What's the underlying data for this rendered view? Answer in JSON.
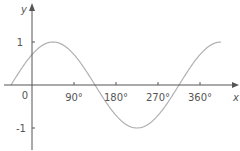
{
  "chart_data": {
    "type": "line",
    "title": "",
    "xlabel": "x",
    "ylabel": "y",
    "function": "y = sin(x + 45°)",
    "xlim": [
      -45,
      405
    ],
    "ylim": [
      -1,
      1
    ],
    "x_ticks": [
      "90°",
      "180°",
      "270°",
      "360°"
    ],
    "y_ticks": [
      "1",
      "-1"
    ],
    "origin_label": "0",
    "grid": false,
    "legend": null,
    "series": [
      {
        "name": "curve",
        "color": "#b0b0b0",
        "x": [
          -45,
          0,
          45,
          90,
          135,
          180,
          225,
          270,
          315,
          360,
          405
        ],
        "y": [
          0,
          0.71,
          1,
          0.71,
          0,
          -0.71,
          -1,
          -0.71,
          0,
          0.71,
          1
        ]
      }
    ]
  },
  "colors": {
    "axis": "#555555",
    "curve": "#b0b0b0"
  }
}
